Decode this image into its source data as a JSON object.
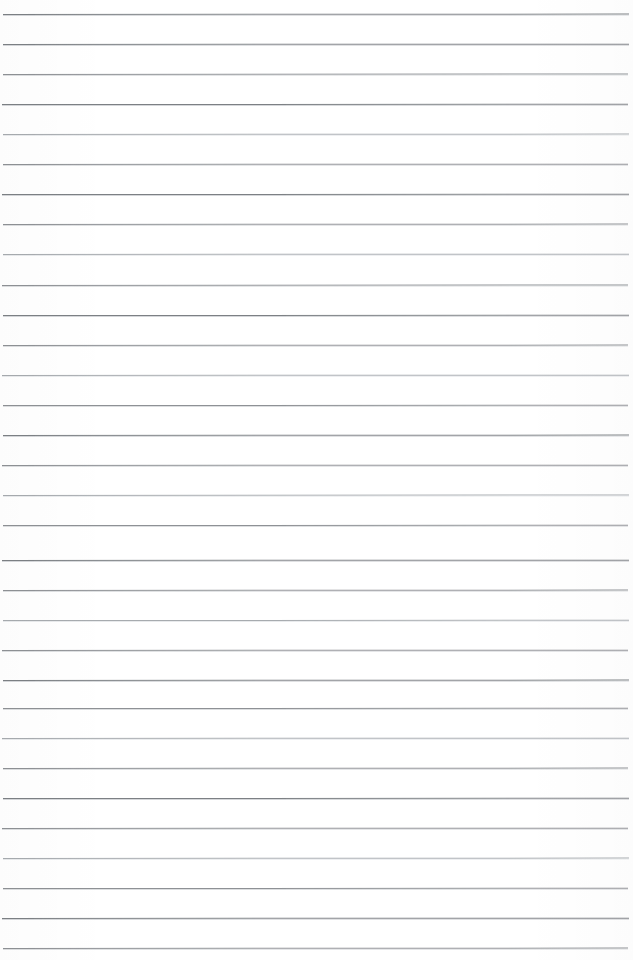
{
  "document": {
    "kind": "scanned-ruled-paper",
    "title": "Blank ruled notebook page",
    "content_text": "",
    "has_handwriting": false,
    "has_printed_text": false,
    "page_width": 633,
    "page_height": 960,
    "background_color": "#ffffff",
    "rule_color": "#8e9195",
    "rule_color_faint": "#a7abaf",
    "rule_color_dark": "#7c8084"
  },
  "ruling": {
    "style": "wide-ruled-horizontal",
    "line_count": 32,
    "first_line_y": 14,
    "line_spacing": 30.1,
    "line_thickness": 1,
    "left_inset": 3,
    "right_inset": 5,
    "margin_rule_visible": false,
    "holes_visible": false,
    "lines": [
      {
        "index": 1,
        "y": 14,
        "x1": 3,
        "x2": 629,
        "tone": "dark",
        "tilt": -0.04
      },
      {
        "index": 2,
        "y": 44,
        "x1": 3,
        "x2": 629,
        "tone": "dark",
        "tilt": -0.03
      },
      {
        "index": 3,
        "y": 74,
        "x1": 3,
        "x2": 628,
        "tone": "normal",
        "tilt": -0.05
      },
      {
        "index": 4,
        "y": 104,
        "x1": 2,
        "x2": 628,
        "tone": "dark",
        "tilt": -0.02
      },
      {
        "index": 5,
        "y": 134,
        "x1": 3,
        "x2": 629,
        "tone": "faint",
        "tilt": -0.04
      },
      {
        "index": 6,
        "y": 164,
        "x1": 3,
        "x2": 628,
        "tone": "normal",
        "tilt": -0.03
      },
      {
        "index": 7,
        "y": 194,
        "x1": 2,
        "x2": 629,
        "tone": "dark",
        "tilt": -0.02
      },
      {
        "index": 8,
        "y": 224,
        "x1": 3,
        "x2": 628,
        "tone": "normal",
        "tilt": -0.04
      },
      {
        "index": 9,
        "y": 254,
        "x1": 3,
        "x2": 629,
        "tone": "faint",
        "tilt": -0.03
      },
      {
        "index": 10,
        "y": 285,
        "x1": 2,
        "x2": 628,
        "tone": "normal",
        "tilt": -0.05
      },
      {
        "index": 11,
        "y": 315,
        "x1": 3,
        "x2": 629,
        "tone": "dark",
        "tilt": -0.02
      },
      {
        "index": 12,
        "y": 345,
        "x1": 3,
        "x2": 628,
        "tone": "normal",
        "tilt": -0.04
      },
      {
        "index": 13,
        "y": 375,
        "x1": 2,
        "x2": 629,
        "tone": "faint",
        "tilt": -0.03
      },
      {
        "index": 14,
        "y": 405,
        "x1": 3,
        "x2": 628,
        "tone": "normal",
        "tilt": -0.02
      },
      {
        "index": 15,
        "y": 435,
        "x1": 3,
        "x2": 629,
        "tone": "dark",
        "tilt": -0.04
      },
      {
        "index": 16,
        "y": 465,
        "x1": 2,
        "x2": 628,
        "tone": "normal",
        "tilt": -0.03
      },
      {
        "index": 17,
        "y": 495,
        "x1": 3,
        "x2": 629,
        "tone": "faint",
        "tilt": -0.05
      },
      {
        "index": 18,
        "y": 525,
        "x1": 3,
        "x2": 628,
        "tone": "normal",
        "tilt": -0.02
      },
      {
        "index": 19,
        "y": 560,
        "x1": 2,
        "x2": 629,
        "tone": "dark",
        "tilt": -0.03
      },
      {
        "index": 20,
        "y": 590,
        "x1": 3,
        "x2": 628,
        "tone": "normal",
        "tilt": -0.04
      },
      {
        "index": 21,
        "y": 620,
        "x1": 3,
        "x2": 629,
        "tone": "faint",
        "tilt": -0.02
      },
      {
        "index": 22,
        "y": 650,
        "x1": 2,
        "x2": 628,
        "tone": "normal",
        "tilt": -0.03
      },
      {
        "index": 23,
        "y": 680,
        "x1": 3,
        "x2": 629,
        "tone": "dark",
        "tilt": -0.04
      },
      {
        "index": 24,
        "y": 708,
        "x1": 3,
        "x2": 628,
        "tone": "normal",
        "tilt": -0.02
      },
      {
        "index": 25,
        "y": 738,
        "x1": 2,
        "x2": 629,
        "tone": "faint",
        "tilt": -0.03
      },
      {
        "index": 26,
        "y": 768,
        "x1": 3,
        "x2": 628,
        "tone": "normal",
        "tilt": -0.04
      },
      {
        "index": 27,
        "y": 798,
        "x1": 3,
        "x2": 629,
        "tone": "dark",
        "tilt": -0.02
      },
      {
        "index": 28,
        "y": 828,
        "x1": 2,
        "x2": 628,
        "tone": "normal",
        "tilt": -0.03
      },
      {
        "index": 29,
        "y": 858,
        "x1": 3,
        "x2": 629,
        "tone": "faint",
        "tilt": -0.04
      },
      {
        "index": 30,
        "y": 888,
        "x1": 3,
        "x2": 628,
        "tone": "normal",
        "tilt": -0.02
      },
      {
        "index": 31,
        "y": 918,
        "x1": 2,
        "x2": 629,
        "tone": "dark",
        "tilt": -0.03
      },
      {
        "index": 32,
        "y": 948,
        "x1": 3,
        "x2": 628,
        "tone": "normal",
        "tilt": -0.04
      }
    ]
  }
}
